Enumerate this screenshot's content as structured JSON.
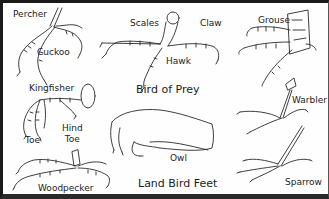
{
  "title": "Land Bird Feet",
  "section_heading": "Bird of Prey",
  "labels": {
    "percher": "Percher",
    "cuckoo": "Cuckoo",
    "scales": "Scales",
    "claw": "Claw",
    "hawk": "Hawk",
    "grouse": "Grouse",
    "kingfisher": "Kingfisher",
    "toe": "Toe",
    "hind_toe_line1": "Hind",
    "hind_toe_line2": "Toe",
    "owl": "Owl",
    "warbler": "Warbler",
    "woodpecker": "Woodpecker",
    "sparrow": "Sparrow"
  },
  "colors": {
    "ink": "#222222",
    "background": "#fefefe",
    "frame": "#1a1a1a"
  }
}
